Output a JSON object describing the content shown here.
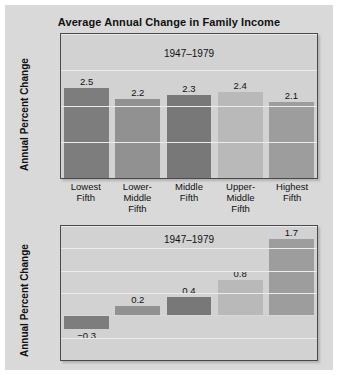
{
  "figure": {
    "title": "Average Annual Change in Family Income",
    "background": "#d9d9d9",
    "frame_border": "#4a4a4a",
    "plot_background": "#d2d2d2"
  },
  "chart_data": [
    {
      "type": "bar",
      "id": "top",
      "title": "Average Annual Change in Family Income",
      "annotation": "1947–1979",
      "xlabel": "",
      "ylabel": "Annual Percent Change",
      "ylim": [
        0,
        4
      ],
      "yticks": [
        0,
        1,
        2,
        3,
        4
      ],
      "ytick_labels": [
        "0",
        "1",
        "2",
        "3",
        "4"
      ],
      "grid": true,
      "legend": "none",
      "categories": [
        "Lowest\nFifth",
        "Lower-\nMiddle Fifth",
        "Middle\nFifth",
        "Upper-\nMiddle Fifth",
        "Highest\nFifth"
      ],
      "category_lines": [
        [
          "Lowest",
          "Fifth"
        ],
        [
          "Lower-",
          "Middle Fifth"
        ],
        [
          "Middle",
          "Fifth"
        ],
        [
          "Upper-",
          "Middle Fifth"
        ],
        [
          "Highest",
          "Fifth"
        ]
      ],
      "values": [
        2.5,
        2.2,
        2.3,
        2.4,
        2.1
      ],
      "value_labels": [
        "2.5",
        "2.2",
        "2.3",
        "2.4",
        "2.1"
      ],
      "bar_colors": [
        "#7d7d7d",
        "#919191",
        "#787878",
        "#b9b9b9",
        "#9d9d9d"
      ]
    },
    {
      "type": "bar",
      "id": "bottom",
      "title": "",
      "annotation": "1947–1979",
      "xlabel": "",
      "ylabel": "Annual Percent Change",
      "ylim": [
        -1.0,
        2.0
      ],
      "yticks": [
        -1.0,
        -0.5,
        0.0,
        0.5,
        1.0,
        1.5,
        2.0
      ],
      "ytick_labels": [
        "−1.0",
        "−0.5",
        "0.0",
        "0.5",
        "1.0",
        "1.5",
        "2.0"
      ],
      "grid": true,
      "legend": "none",
      "categories": [
        "Lowest\nFifth",
        "Lower-\nMiddle Fifth",
        "Middle\nFifth",
        "Upper-\nMiddle Fifth",
        "Highest\nFifth"
      ],
      "values": [
        -0.3,
        0.2,
        0.4,
        0.8,
        1.7
      ],
      "value_labels": [
        "−0.3",
        "0.2",
        "0.4",
        "0.8",
        "1.7"
      ],
      "bar_colors": [
        "#7d7d7d",
        "#919191",
        "#787878",
        "#b9b9b9",
        "#9d9d9d"
      ]
    }
  ]
}
